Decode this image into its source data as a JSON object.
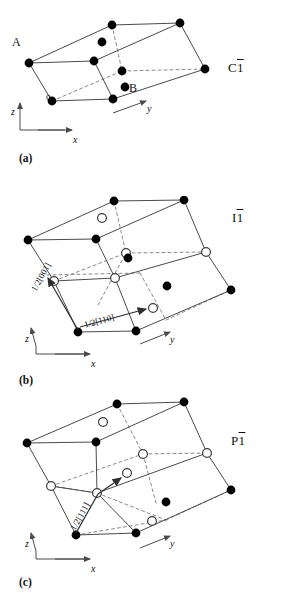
{
  "figure": {
    "caption_panels": [
      "(a)",
      "(b)",
      "(c)"
    ]
  },
  "panels": [
    {
      "tag": "(a)",
      "lattice_symbol_letter": "C",
      "lattice_symbol_number": "1",
      "axes": {
        "x": "x",
        "y": "y",
        "z": "z",
        "origin": "o"
      },
      "point_labels": [
        {
          "text": "A"
        },
        {
          "text": "B"
        }
      ],
      "vectors": []
    },
    {
      "tag": "(b)",
      "lattice_symbol_letter": "I",
      "lattice_symbol_number": "1",
      "axes": {
        "x": "x",
        "y": "y",
        "z": "z",
        "origin": ""
      },
      "point_labels": [],
      "vectors": [
        {
          "text": "1/2[001]"
        },
        {
          "text": "1/2[110]"
        }
      ]
    },
    {
      "tag": "(c)",
      "lattice_symbol_letter": "P",
      "lattice_symbol_number": "1",
      "axes": {
        "x": "x",
        "y": "y",
        "z": "z",
        "origin": ""
      },
      "point_labels": [],
      "vectors": [
        {
          "text": "1/2[111]"
        }
      ]
    }
  ],
  "legend": {
    "filled_circle_meaning": "lattice point",
    "open_circle_meaning": "centring point"
  },
  "colors": {
    "line": "#4a4a4a",
    "dashed": "#7d7d7d",
    "filled_node": "#000000",
    "open_node_fill": "#ffffff",
    "open_node_stroke": "#3c3c3c",
    "text": "#111111",
    "background": "#ffffff"
  }
}
